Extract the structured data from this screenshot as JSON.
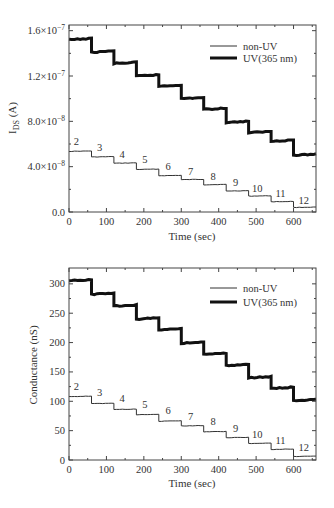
{
  "chart_data": [
    {
      "type": "line",
      "id": "ids",
      "title": "",
      "xlabel": "Time (sec)",
      "ylabel": "I_DS (A)",
      "ylabel_main": "I",
      "ylabel_sub": "DS",
      "ylabel_tail": " (A)",
      "xlim": [
        0,
        660
      ],
      "ylim": [
        0,
        1.65e-07
      ],
      "xticks": [
        0,
        100,
        200,
        300,
        400,
        500,
        600
      ],
      "xtick_labels": [
        "0",
        "100",
        "200",
        "300",
        "400",
        "500",
        "600"
      ],
      "yticks": [
        0,
        4e-08,
        8e-08,
        1.2e-07,
        1.6e-07
      ],
      "ytick_labels": [
        {
          "mant": "0.0",
          "exp": ""
        },
        {
          "mant": "4.0×10",
          "exp": "−8"
        },
        {
          "mant": "8.0×10",
          "exp": "−8"
        },
        {
          "mant": "1.2×10",
          "exp": "−7"
        },
        {
          "mant": "1.6×10",
          "exp": "−7"
        }
      ],
      "grid": false,
      "legend_position": "upper right",
      "series": [
        {
          "name": "non-UV",
          "line_width": 1,
          "color": "#333333",
          "step_starts": [
            0,
            60,
            120,
            180,
            240,
            300,
            360,
            420,
            480,
            540,
            600
          ],
          "step_values": [
            5.35e-08,
            4.85e-08,
            4.3e-08,
            3.75e-08,
            3.2e-08,
            2.85e-08,
            2.4e-08,
            1.85e-08,
            1.4e-08,
            9e-09,
            4e-09
          ]
        },
        {
          "name": "UV(365 nm)",
          "line_width": 3,
          "color": "#111111",
          "step_starts": [
            0,
            60,
            120,
            180,
            240,
            300,
            360,
            420,
            480,
            540,
            600
          ],
          "step_values": [
            1.52e-07,
            1.41e-07,
            1.31e-07,
            1.2e-07,
            1.11e-07,
            1e-07,
            9.05e-08,
            7.9e-08,
            7e-08,
            6.25e-08,
            5e-08
          ]
        }
      ],
      "annotations": [
        {
          "text": "2",
          "x": 20,
          "y": 5.9e-08
        },
        {
          "text": "3",
          "x": 82,
          "y": 5.35e-08
        },
        {
          "text": "4",
          "x": 142,
          "y": 4.8e-08
        },
        {
          "text": "5",
          "x": 203,
          "y": 4.3e-08
        },
        {
          "text": "6",
          "x": 265,
          "y": 3.75e-08
        },
        {
          "text": "7",
          "x": 325,
          "y": 3.3e-08
        },
        {
          "text": "8",
          "x": 385,
          "y": 2.8e-08
        },
        {
          "text": "9",
          "x": 445,
          "y": 2.3e-08
        },
        {
          "text": "10",
          "x": 503,
          "y": 1.75e-08
        },
        {
          "text": "11",
          "x": 565,
          "y": 1.3e-08
        },
        {
          "text": "12",
          "x": 627,
          "y": 7e-09
        }
      ]
    },
    {
      "type": "line",
      "id": "conductance",
      "title": "",
      "xlabel": "Time (sec)",
      "ylabel": "Conductance (nS)",
      "xlim": [
        0,
        660
      ],
      "ylim": [
        0,
        327
      ],
      "xticks": [
        0,
        100,
        200,
        300,
        400,
        500,
        600
      ],
      "xtick_labels": [
        "0",
        "100",
        "200",
        "300",
        "400",
        "500",
        "600"
      ],
      "yticks": [
        0,
        50,
        100,
        150,
        200,
        250,
        300
      ],
      "ytick_labels": [
        "0",
        "50",
        "100",
        "150",
        "200",
        "250",
        "300"
      ],
      "grid": false,
      "legend_position": "upper right",
      "series": [
        {
          "name": "non-UV",
          "line_width": 1,
          "color": "#333333",
          "step_starts": [
            0,
            60,
            120,
            180,
            240,
            300,
            360,
            420,
            480,
            540,
            600
          ],
          "step_values": [
            108,
            96,
            86,
            77,
            66,
            58,
            48,
            38,
            28,
            18,
            6
          ]
        },
        {
          "name": "UV(365 nm)",
          "line_width": 3,
          "color": "#111111",
          "step_starts": [
            0,
            60,
            120,
            180,
            240,
            300,
            360,
            420,
            480,
            540,
            600
          ],
          "step_values": [
            305,
            282,
            262,
            240,
            222,
            199,
            180,
            161,
            140,
            122,
            101
          ]
        }
      ],
      "annotations": [
        {
          "text": "2",
          "x": 20,
          "y": 120
        },
        {
          "text": "3",
          "x": 82,
          "y": 109
        },
        {
          "text": "4",
          "x": 142,
          "y": 98
        },
        {
          "text": "5",
          "x": 203,
          "y": 89
        },
        {
          "text": "6",
          "x": 265,
          "y": 78
        },
        {
          "text": "7",
          "x": 325,
          "y": 68
        },
        {
          "text": "8",
          "x": 385,
          "y": 59
        },
        {
          "text": "9",
          "x": 445,
          "y": 48
        },
        {
          "text": "10",
          "x": 503,
          "y": 38
        },
        {
          "text": "11",
          "x": 565,
          "y": 27
        },
        {
          "text": "12",
          "x": 627,
          "y": 15
        }
      ]
    }
  ],
  "legend": {
    "non_uv_label": "non-UV",
    "uv_label": "UV(365 nm)"
  }
}
